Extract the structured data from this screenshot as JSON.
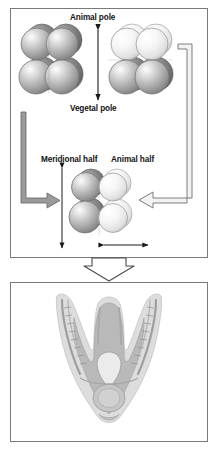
{
  "figure": {
    "panels": [
      {
        "id": "panel-top",
        "name": "blastomere-separation-panel",
        "labels": {
          "animal_pole": "Animal pole",
          "vegetal_pole": "Vegetal pole",
          "meridional_half": "Meridional half",
          "animal_half": "Animal half"
        },
        "clusters": [
          {
            "name": "meridional-cleavage-cluster",
            "description": "8-cell embryo split into meridional halves, uniformly gray blastomeres"
          },
          {
            "name": "equatorial-cleavage-cluster",
            "description": "8-cell embryo split equatorially, light animal tier over gray vegetal tier"
          },
          {
            "name": "combined-half-cluster",
            "description": "gray meridional half joined to light animal half"
          }
        ],
        "arrows": [
          {
            "name": "animal-vegetal-axis-arrow",
            "style": "thin double-headed vertical"
          },
          {
            "name": "left-recycle-arrow",
            "style": "thick gray elbow pointing right"
          },
          {
            "name": "right-recycle-arrow",
            "style": "outlined elbow pointing left"
          },
          {
            "name": "cluster-height-arrow",
            "style": "thin double-headed vertical"
          },
          {
            "name": "cluster-width-arrow",
            "style": "thin double-headed horizontal"
          }
        ]
      },
      {
        "id": "panel-bottom",
        "name": "larva-micrograph-panel",
        "image_name": "pluteus-larva-micrograph",
        "description": "grayscale micrograph of a V-shaped pluteus larva with paired arms"
      }
    ],
    "connector": {
      "name": "panel-connector-chevron",
      "style": "outlined downward arrow"
    },
    "caption": ""
  },
  "colors": {
    "panel_border": "#7a7a7a",
    "label_text": "#121212",
    "sphere_gray": "#a8a8a8",
    "sphere_light": "#ececec",
    "sphere_dark": "#6e6e6e",
    "arrow_gray": "#8a8a8a",
    "background": "#ffffff"
  }
}
